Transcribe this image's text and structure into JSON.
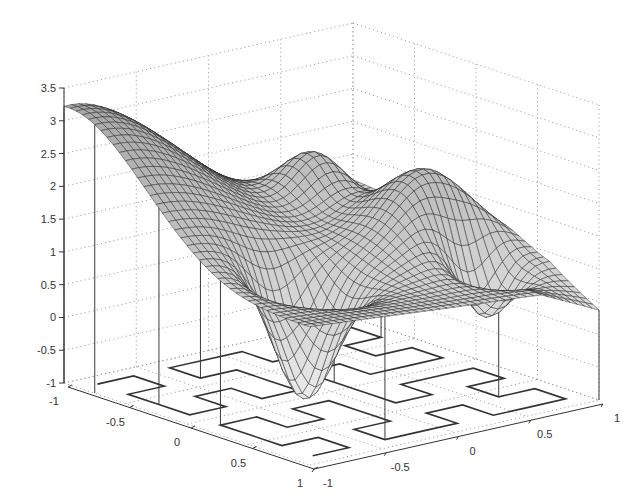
{
  "chart_data": {
    "type": "surface3d",
    "title": "",
    "xlabel": "",
    "ylabel": "",
    "zlabel": "",
    "xlim": [
      -1,
      1
    ],
    "ylim": [
      -1,
      1
    ],
    "zlim": [
      -1,
      3.5
    ],
    "grid": true,
    "x_ticks": [
      "-1",
      "-0.5",
      "0",
      "0.5",
      "1"
    ],
    "y_ticks": [
      "-1",
      "-0.5",
      "0",
      "0.5",
      "1"
    ],
    "z_ticks": [
      "-1",
      "-0.5",
      "0",
      "0.5",
      "1",
      "1.5",
      "2",
      "2.5",
      "3",
      "3.5"
    ],
    "surface": {
      "description": "Mesh surface over [-1,1]x[-1,1] with max ~3.4 at corner (-1,-1), two deep wells (min ~ -0.6), a ridge/hump ~2.3 and a low edge ~0.3 at (1,1)",
      "max_value": 3.4,
      "min_value": -0.65,
      "grid_resolution": 40
    },
    "floor_pattern": "space-filling (Hilbert-like) curve projected on z = -1 plane",
    "stems": "vertical lines from floor curve sample points up to surface"
  },
  "axes": {
    "z_tick_values": [
      -1,
      -0.5,
      0,
      0.5,
      1,
      1.5,
      2,
      2.5,
      3,
      3.5
    ],
    "x_tick_values": [
      -1,
      -0.5,
      0,
      0.5,
      1
    ],
    "y_tick_values": [
      -1,
      -0.5,
      0,
      0.5,
      1
    ]
  }
}
